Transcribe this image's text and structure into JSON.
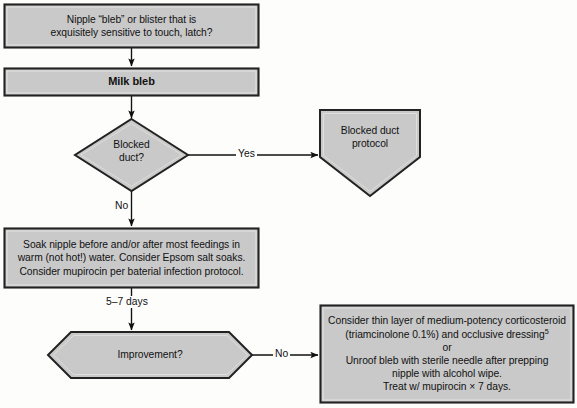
{
  "diagram": {
    "palette": {
      "node_fill": "#c9c9c9",
      "node_stroke": "#222222",
      "node_bevel": "#e8e8e8",
      "connector": "#111111",
      "background": "#fdfdfc",
      "text": "#111111"
    },
    "nodes": [
      {
        "id": "start",
        "name": "start-box",
        "shape": "rectangle",
        "lines": [
          "Nipple “bleb” or blister that is",
          "exquisitely sensitive to touch, latch?"
        ]
      },
      {
        "id": "milk-bleb",
        "name": "milk-bleb-box",
        "shape": "rectangle",
        "bold": true,
        "lines": [
          "Milk bleb"
        ]
      },
      {
        "id": "blocked-duct",
        "name": "blocked-duct-decision",
        "shape": "diamond",
        "lines": [
          "Blocked",
          "duct?"
        ]
      },
      {
        "id": "blocked-duct-protocol",
        "name": "blocked-duct-protocol-node",
        "shape": "pentagon-down",
        "lines": [
          "Blocked duct",
          "protocol"
        ]
      },
      {
        "id": "soak",
        "name": "soak-instructions-box",
        "shape": "rectangle",
        "lines": [
          "Soak nipple before and/or after most feedings in",
          "warm (not hot!) water. Consider Epsom salt soaks.",
          "Consider mupirocin per baterial infection protocol."
        ]
      },
      {
        "id": "improvement",
        "name": "improvement-decision",
        "shape": "hexagon",
        "lines": [
          "Improvement?"
        ]
      },
      {
        "id": "treatment",
        "name": "treatment-box",
        "shape": "rectangle",
        "lines": [
          "Consider thin layer of medium-potency corticosteroid",
          "(triamcinolone 0.1%) and occlusive dressing",
          "or",
          "Unroof bleb with sterile needle after prepping",
          "nipple with alcohol wipe.",
          "Treat w/ mupirocin × 7 days."
        ],
        "superscript": "5"
      }
    ],
    "edges": [
      {
        "id": "e1",
        "name": "edge-start-to-milkbleb",
        "label": ""
      },
      {
        "id": "e2",
        "name": "edge-milkbleb-to-blockedduct",
        "label": ""
      },
      {
        "id": "e3",
        "name": "edge-blockedduct-yes",
        "label": "Yes"
      },
      {
        "id": "e4",
        "name": "edge-blockedduct-no",
        "label": "No"
      },
      {
        "id": "e5",
        "name": "edge-soak-to-improvement",
        "label": "5–7 days"
      },
      {
        "id": "e6",
        "name": "edge-improvement-no",
        "label": "No"
      }
    ]
  }
}
